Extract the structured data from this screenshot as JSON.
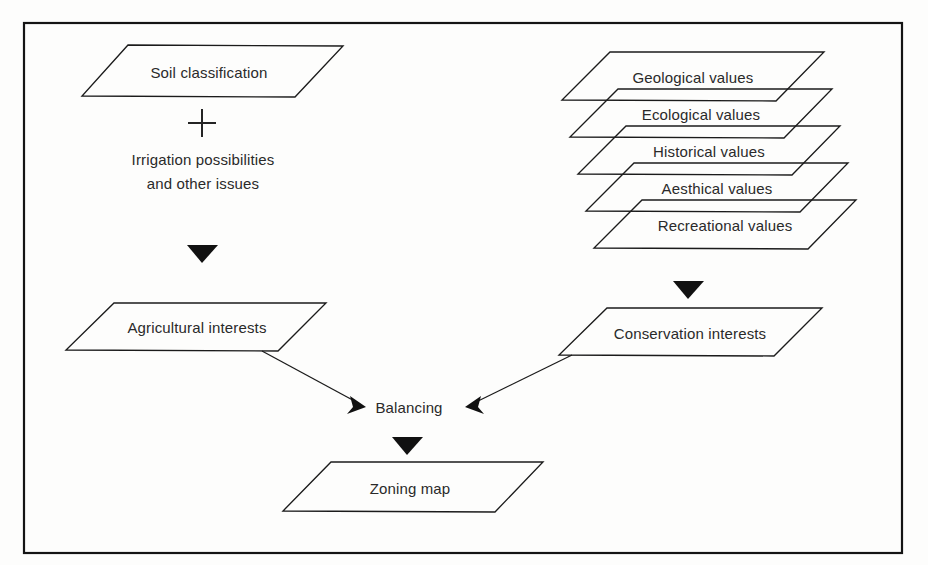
{
  "diagram": {
    "background_color": "#fdfdfc",
    "line_color": "#1b1b1b",
    "text_color": "#2a2a2a",
    "nodes": {
      "soil_classification": "Soil classification",
      "plus_sign": "+",
      "irrigation_line1": "Irrigation possibilities",
      "irrigation_line2": "and other issues",
      "agricultural_interests": "Agricultural interests",
      "conservation_interests": "Conservation interests",
      "balancing": "Balancing",
      "zoning_map": "Zoning map"
    },
    "value_stack": [
      "Geological values",
      "Ecological values",
      "Historical values",
      "Aesthical values",
      "Recreational values"
    ],
    "arrows": [
      "soil-to-agricultural-interests",
      "values-stack-to-conservation-interests",
      "agricultural-interests-to-balancing",
      "conservation-interests-to-balancing",
      "balancing-to-zoning-map"
    ]
  }
}
